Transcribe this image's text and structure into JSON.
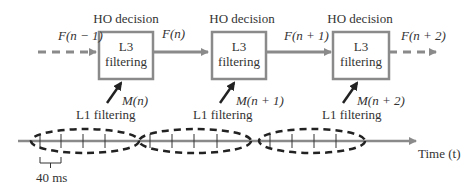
{
  "diagram": {
    "stages": [
      {
        "decision_label": "HO decision",
        "box_line1": "L3",
        "box_line2": "filtering",
        "measurement": "M(n)",
        "l1_label": "L1 filtering"
      },
      {
        "decision_label": "HO decision",
        "box_line1": "L3",
        "box_line2": "filtering",
        "measurement": "M(n + 1)",
        "l1_label": "L1 filtering"
      },
      {
        "decision_label": "HO decision",
        "box_line1": "L3",
        "box_line2": "filtering",
        "measurement": "M(n + 2)",
        "l1_label": "L1 filtering"
      }
    ],
    "flow_labels": [
      "F(n − 1)",
      "F(n)",
      "F(n + 1)",
      "F(n + 2)"
    ],
    "time_axis_label": "Time (t)",
    "interval_label": "40 ms",
    "colors": {
      "gray": "#8a8a8a",
      "dark": "#222222",
      "box_border": "#8a8a8a"
    }
  }
}
